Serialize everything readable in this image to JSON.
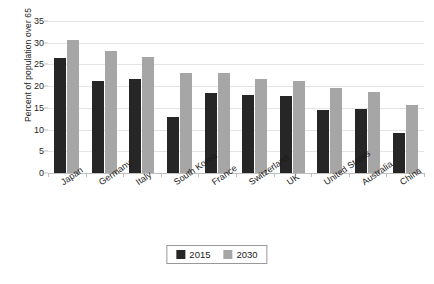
{
  "chart_data": {
    "type": "bar",
    "title": "",
    "subtitle": "",
    "xlabel": "",
    "ylabel": "Percent of population over 65",
    "ylim": [
      0,
      35
    ],
    "ytick_step": 5,
    "yticks": [
      35,
      30,
      25,
      20,
      15,
      10,
      5,
      0
    ],
    "grid": true,
    "grid_axis": "y",
    "legend_position": "bottom-center",
    "orientation": "vertical",
    "categories": [
      "Japan",
      "Germany",
      "Italy",
      "South Korea",
      "France",
      "Switzerland",
      "UK",
      "United States",
      "Australia",
      "China"
    ],
    "series": [
      {
        "name": "2015",
        "color": "#262626",
        "values": [
          26.4,
          21.3,
          21.6,
          12.8,
          18.4,
          18.0,
          17.8,
          14.5,
          14.7,
          9.2
        ]
      },
      {
        "name": "2030",
        "color": "#a6a6a6",
        "values": [
          30.6,
          28.1,
          26.7,
          23.1,
          23.0,
          21.6,
          21.3,
          19.6,
          18.7,
          15.7
        ]
      }
    ],
    "annotations": []
  },
  "colors": {
    "series_2015": "#262626",
    "series_2030": "#a6a6a6",
    "gridline": "#e4e4e4",
    "axis": "#bfbfbf",
    "background": "#ffffff",
    "text": "#1a1a1a"
  }
}
